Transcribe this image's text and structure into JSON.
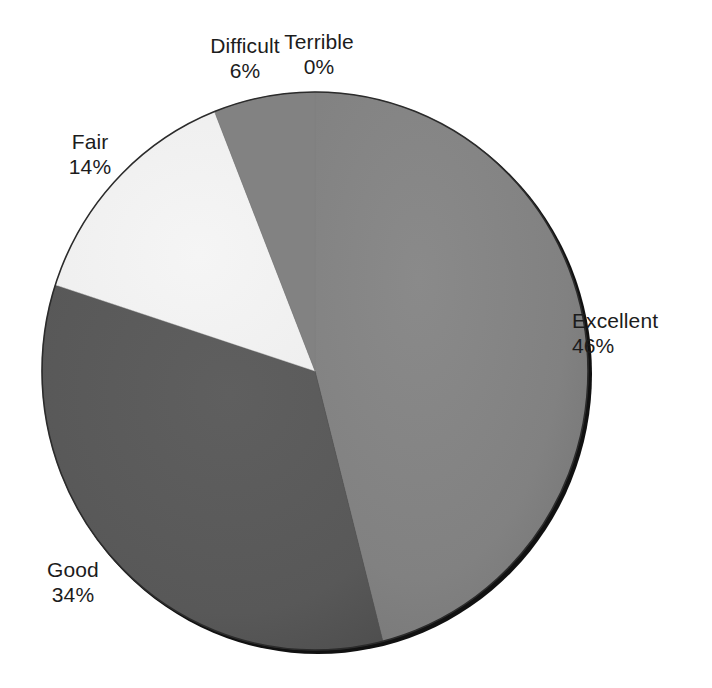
{
  "chart_data": {
    "type": "pie",
    "title": "",
    "subtitle": "",
    "xlabel": "",
    "ylabel": "",
    "legend_position": "none",
    "grid": false,
    "labels_show_percent": true,
    "start_angle_deg": 0,
    "direction": "clockwise",
    "categories": [
      "Terrible",
      "Excellent",
      "Good",
      "Fair",
      "Difficult"
    ],
    "values": [
      0,
      46,
      34,
      14,
      6
    ],
    "units": "%",
    "slices": [
      {
        "name": "Terrible",
        "value": 0,
        "percent_label": "0%",
        "color": "#808080",
        "start_deg": 0,
        "end_deg": 0
      },
      {
        "name": "Excellent",
        "value": 46,
        "percent_label": "46%",
        "color": "#808080",
        "start_deg": 0,
        "end_deg": 165.6
      },
      {
        "name": "Good",
        "value": 34,
        "percent_label": "34%",
        "color": "#595959",
        "start_deg": 165.6,
        "end_deg": 288.0
      },
      {
        "name": "Fair",
        "value": 14,
        "percent_label": "14%",
        "color": "#f2f2f2",
        "start_deg": 288.0,
        "end_deg": 338.4
      },
      {
        "name": "Difficult",
        "value": 6,
        "percent_label": "6%",
        "color": "#808080",
        "start_deg": 338.4,
        "end_deg": 360.0
      }
    ]
  },
  "labels": {
    "difficult": {
      "name": "Difficult",
      "value": "6%"
    },
    "terrible": {
      "name": "Terrible",
      "value": "0%"
    },
    "fair": {
      "name": "Fair",
      "value": "14%"
    },
    "excellent": {
      "name": "Excellent",
      "value": "46%"
    },
    "good": {
      "name": "Good",
      "value": "34%"
    }
  },
  "colors": {
    "background": "#ffffff",
    "excellent": "#808080",
    "good": "#595959",
    "fair": "#f2f2f2",
    "difficult": "#808080",
    "terrible": "#808080",
    "outline": "#1a1a1a",
    "text": "#1c1c1c"
  }
}
